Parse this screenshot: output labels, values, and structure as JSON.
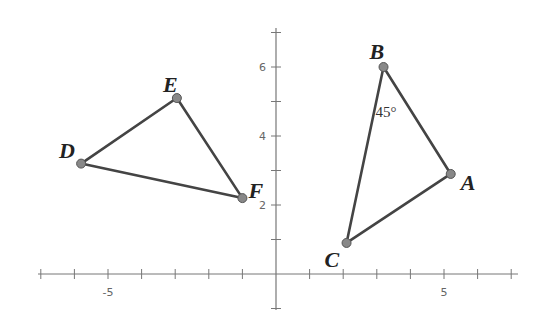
{
  "diagram": {
    "axes": {
      "x_ticks": [
        -7,
        -6,
        -5,
        -4,
        -3,
        -2,
        -1,
        0,
        1,
        2,
        3,
        4,
        5,
        6,
        7
      ],
      "x_labels": [
        {
          "value": -5,
          "text": "-5"
        },
        {
          "value": 5,
          "text": "5"
        }
      ],
      "y_ticks": [
        -1,
        1,
        2,
        3,
        4,
        5,
        6,
        7
      ],
      "y_labels": [
        {
          "value": 2,
          "text": "2"
        },
        {
          "value": 4,
          "text": "4"
        },
        {
          "value": 6,
          "text": "6"
        }
      ]
    },
    "triangles": [
      {
        "name": "ABC",
        "vertices": [
          {
            "label": "A",
            "x": 5.2,
            "y": 2.9
          },
          {
            "label": "B",
            "x": 3.2,
            "y": 6.0
          },
          {
            "label": "C",
            "x": 2.1,
            "y": 0.9
          }
        ],
        "angle_annotation": {
          "vertex": "B",
          "text": "45°"
        }
      },
      {
        "name": "DEF",
        "vertices": [
          {
            "label": "D",
            "x": -5.8,
            "y": 3.2
          },
          {
            "label": "E",
            "x": -2.95,
            "y": 5.1
          },
          {
            "label": "F",
            "x": -1.0,
            "y": 2.2
          }
        ]
      }
    ],
    "colors": {
      "line": "#444444",
      "point": "#888888",
      "axis": "#777777"
    }
  }
}
